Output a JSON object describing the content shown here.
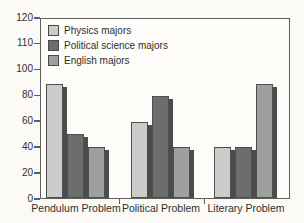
{
  "chart_data": {
    "type": "bar",
    "title": "",
    "categories": [
      "Pendulum Problem",
      "Political Problem",
      "Literary Problem"
    ],
    "series": [
      {
        "name": "Physics majors",
        "color": "#cbcdca",
        "values": [
          90,
          60,
          40
        ]
      },
      {
        "name": "Political science majors",
        "color": "#6c6e6d",
        "values": [
          50,
          80,
          40
        ]
      },
      {
        "name": "English majors",
        "color": "#9da09d",
        "values": [
          40,
          40,
          90
        ]
      }
    ],
    "y_ticks": [
      0,
      20,
      40,
      60,
      80,
      100,
      110,
      120
    ],
    "ylim": [
      0,
      120
    ],
    "xlabel": "",
    "ylabel": "",
    "grid": false,
    "legend_position": "top-left",
    "bar_style": "drop-shadow-right"
  },
  "colors": {
    "page_bg": "#fbfaf6",
    "plot_bg": "#fdfcf9",
    "frame": "#5f5f5f",
    "bar_border": "#4f4f4f",
    "bar_shadow": "#4a4c4b",
    "text": "#2f2f2f"
  }
}
